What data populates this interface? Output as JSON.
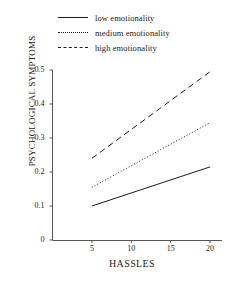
{
  "legend": {
    "position": "top",
    "entries": [
      {
        "label": "low emotionality",
        "style": "solid"
      },
      {
        "label": "medium emotionality",
        "style": "dotted"
      },
      {
        "label": "high emotionality",
        "style": "dashed"
      }
    ]
  },
  "axes": {
    "xlabel": "HASSLES",
    "ylabel": "PSYCHOLOGICAL SYMPTOMS",
    "xticks": [
      "5",
      "10",
      "15",
      "20"
    ],
    "yticks": [
      "0",
      "0.1",
      "0.2",
      "0.3",
      "0.4",
      "0.5"
    ]
  },
  "colors": {
    "line": "#1a1a1a",
    "axis": "#555555",
    "background": "#ffffff"
  },
  "chart_data": {
    "type": "line",
    "title": "",
    "subtitle": "",
    "xlabel": "HASSLES",
    "ylabel": "PSYCHOLOGICAL SYMPTOMS",
    "xlim": [
      0,
      20
    ],
    "ylim": [
      0,
      0.5
    ],
    "xticks": [
      5,
      10,
      15,
      20
    ],
    "yticks": [
      0,
      0.1,
      0.2,
      0.3,
      0.4,
      0.5
    ],
    "grid": false,
    "legend_position": "top",
    "x": [
      5,
      20
    ],
    "series": [
      {
        "name": "low emotionality",
        "style": "solid",
        "values": [
          0.1,
          0.215
        ]
      },
      {
        "name": "medium emotionality",
        "style": "dotted",
        "values": [
          0.155,
          0.345
        ]
      },
      {
        "name": "high emotionality",
        "style": "dashed",
        "values": [
          0.24,
          0.495
        ]
      }
    ]
  }
}
